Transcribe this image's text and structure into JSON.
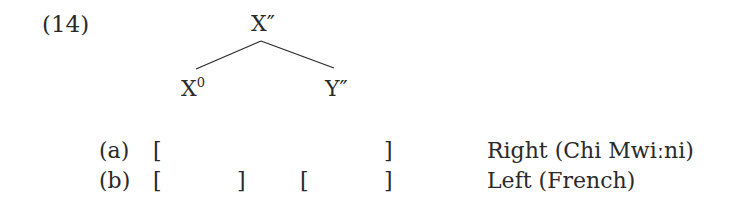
{
  "example": {
    "number": "(14)",
    "tree": {
      "root": {
        "label": "X",
        "mark": "″"
      },
      "left_child": {
        "label": "X",
        "sup": "0"
      },
      "right_child": {
        "label": "Y",
        "mark": "″"
      }
    },
    "rows": [
      {
        "marker": "(a)",
        "brackets": [
          "[",
          "]"
        ],
        "description": "Right (Chi Mwiːni)"
      },
      {
        "marker": "(b)",
        "brackets": [
          "[",
          "]",
          "[",
          "]"
        ],
        "description": "Left (French)"
      }
    ]
  }
}
